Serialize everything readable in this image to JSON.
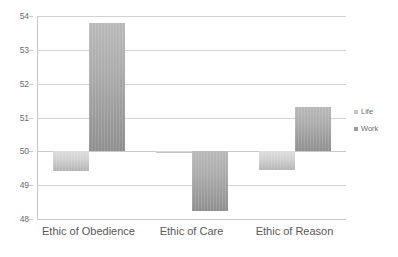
{
  "chart_data": {
    "type": "bar",
    "title": "",
    "subtitle": "",
    "xlabel": "",
    "ylabel": "",
    "categories": [
      "Ethic of Obedience",
      "Ethic of Care",
      "Ethic of Reason"
    ],
    "series": [
      {
        "name": "Life",
        "values": [
          49.42,
          49.95,
          49.45
        ]
      },
      {
        "name": "Work",
        "values": [
          53.79,
          48.25,
          51.3
        ]
      }
    ],
    "ylim": [
      48,
      54
    ],
    "yticks": [
      54,
      53,
      52,
      51,
      50,
      49,
      48
    ],
    "ytick_labels": [
      "54",
      "53",
      "52",
      "51",
      "50",
      "49",
      "48"
    ],
    "baseline": 50,
    "grid": true,
    "grid_axis": "y",
    "legend_position": "right",
    "legend": [
      "Life",
      "Work"
    ],
    "colors": {
      "life": "#d0d0d0",
      "work": "#a6a6a6",
      "gridline": "#d2d2d2",
      "axis": "#c8c8c8",
      "tick_text": "#6b6b6b",
      "category_text": "#58585a",
      "background": "#ffffff"
    }
  },
  "axis": {
    "y": {
      "ticks": [
        {
          "label": "54",
          "value": 54
        },
        {
          "label": "53",
          "value": 53
        },
        {
          "label": "52",
          "value": 52
        },
        {
          "label": "51",
          "value": 51
        },
        {
          "label": "50",
          "value": 50
        },
        {
          "label": "49",
          "value": 49
        },
        {
          "label": "48",
          "value": 48
        }
      ]
    },
    "x": {
      "ticks": [
        {
          "label": "Ethic of Obedience"
        },
        {
          "label": "Ethic of Care"
        },
        {
          "label": "Ethic of Reason"
        }
      ]
    }
  },
  "legend": {
    "items": [
      {
        "label": "Life",
        "marker": "square-swatch-icon"
      },
      {
        "label": "Work",
        "marker": "square-swatch-icon"
      }
    ]
  }
}
